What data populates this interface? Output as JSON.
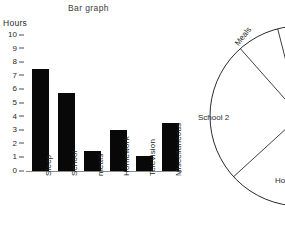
{
  "chart_data": [
    {
      "type": "bar",
      "title": "Bar graph",
      "xlabel": "",
      "ylabel": "Hours",
      "ylim": [
        0,
        10
      ],
      "yticks": [
        0,
        1,
        2,
        3,
        4,
        5,
        6,
        7,
        8,
        9,
        10
      ],
      "grid": false,
      "legend": "none",
      "bar_color": "#080808",
      "categories": [
        "Sleep",
        "School",
        "meals",
        "Homework",
        "Television",
        "Miscellaneous"
      ],
      "values": [
        7.5,
        5.7,
        1.5,
        3.0,
        1.1,
        3.5
      ]
    },
    {
      "type": "pie",
      "title": "",
      "note": "circle clipped by right edge of image; center lies off-screen",
      "slices": [
        {
          "label": "Meals",
          "value": ""
        },
        {
          "label": "School 2",
          "value": "2"
        },
        {
          "label": "Ho",
          "value": ""
        }
      ],
      "stroke_color": "#2a2a2a",
      "fill_color": "#ffffff"
    }
  ],
  "bar_chart": {
    "title": "Bar graph",
    "y_caption": "Hours",
    "yticks": [
      "10",
      "9",
      "8",
      "7",
      "6",
      "5",
      "4",
      "3",
      "2",
      "1",
      "0"
    ],
    "bars": [
      {
        "label": "Sleep",
        "value": 7.5
      },
      {
        "label": "School",
        "value": 5.7
      },
      {
        "label": "meals",
        "value": 1.5
      },
      {
        "label": "Homework",
        "value": 3.0
      },
      {
        "label": "Television",
        "value": 1.1
      },
      {
        "label": "Miscellaneous",
        "value": 3.5
      }
    ]
  },
  "pie_chart": {
    "labels": {
      "meals": "Meals",
      "school": "School 2",
      "homework": "Ho"
    }
  }
}
